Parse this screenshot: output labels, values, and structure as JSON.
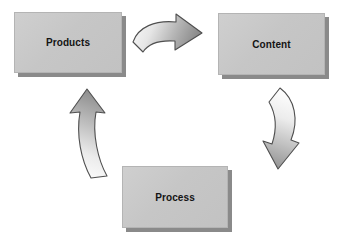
{
  "diagram": {
    "background_color": "#ffffff",
    "node_fill_color": "#c6c6c6",
    "node_shadow_color": "#8a8a8a",
    "arrow_outline_color": "#4a4a4a",
    "arrow_light_color": "#f4f4f4",
    "arrow_dark_color": "#8e8e8e",
    "label_color": "#141414",
    "nodes": [
      {
        "id": "products",
        "label": "Products",
        "x": 14,
        "y": 12,
        "w": 108,
        "h": 61
      },
      {
        "id": "content",
        "label": "Content",
        "x": 218,
        "y": 13,
        "w": 107,
        "h": 62
      },
      {
        "id": "process",
        "label": "Process",
        "x": 122,
        "y": 166,
        "w": 106,
        "h": 62
      }
    ],
    "arrows": [
      {
        "id": "products-to-content",
        "from": "products",
        "to": "content",
        "direction": "right"
      },
      {
        "id": "content-to-process",
        "from": "content",
        "to": "process",
        "direction": "down-left"
      },
      {
        "id": "process-to-products",
        "from": "process",
        "to": "products",
        "direction": "up"
      }
    ]
  }
}
